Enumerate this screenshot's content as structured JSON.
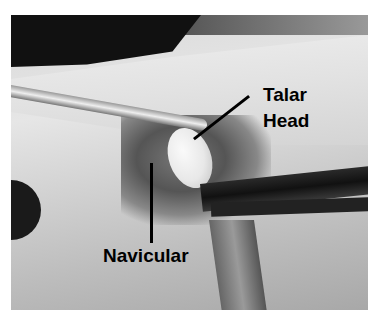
{
  "image": {
    "description": "Intraoperative grayscale photograph of a foot showing exposed bony anatomy with forceps and retractors",
    "labels": [
      {
        "id": "talar_head",
        "lines": [
          "Talar",
          "Head"
        ]
      },
      {
        "id": "navicular",
        "text": "Navicular"
      }
    ]
  },
  "colors": {
    "background": "#ffffff",
    "label": "#000000"
  }
}
